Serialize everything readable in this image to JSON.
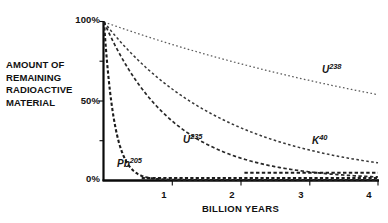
{
  "chart_data": {
    "type": "line",
    "title": "",
    "subtitle": "",
    "xlabel": "BILLION YEARS",
    "ylabel": "AMOUNT OF REMAINING RADIOACTIVE MATERIAL",
    "ylabel_lines": [
      "AMOUNT OF",
      "REMAINING",
      "RADIOACTIVE",
      "MATERIAL"
    ],
    "xlim": [
      0,
      4
    ],
    "ylim": [
      0,
      100
    ],
    "x_ticks": [
      1,
      2,
      3,
      4
    ],
    "x_tick_labels": [
      "1",
      "2",
      "3",
      "4"
    ],
    "y_ticks": [
      0,
      25,
      50,
      75,
      100
    ],
    "y_tick_labels_shown": [
      "0%",
      "50%",
      "100%"
    ],
    "y_tick_values_shown": [
      0,
      50,
      100
    ],
    "grid": false,
    "legend": "inline-annotations",
    "line_style": "dashed",
    "x": [
      0,
      0.25,
      0.5,
      0.75,
      1,
      1.25,
      1.5,
      1.75,
      2,
      2.25,
      2.5,
      2.75,
      3,
      3.25,
      3.5,
      3.75,
      4
    ],
    "series": [
      {
        "name": "U-238",
        "label_element": "U",
        "label_mass": "238",
        "half_life_billion_years": 4.5,
        "values": [
          100,
          96.2,
          92.6,
          89.1,
          85.7,
          82.4,
          79.4,
          76.3,
          73.5,
          70.7,
          68.0,
          65.4,
          63.0,
          60.6,
          58.3,
          56.1,
          53.9
        ]
      },
      {
        "name": "K-40",
        "label_element": "K",
        "label_mass": "40",
        "half_life_billion_years": 1.25,
        "values": [
          100,
          87.1,
          75.8,
          66.0,
          57.4,
          50.0,
          43.5,
          37.9,
          33.0,
          28.7,
          25.0,
          21.8,
          18.9,
          16.5,
          14.3,
          12.5,
          10.9
        ]
      },
      {
        "name": "U-235",
        "label_element": "U",
        "label_mass": "235",
        "half_life_billion_years": 0.7,
        "values": [
          100,
          78.1,
          61.0,
          47.6,
          37.2,
          29.1,
          22.7,
          17.7,
          13.8,
          10.8,
          8.4,
          6.6,
          5.1,
          4.0,
          3.1,
          2.4,
          1.9
        ]
      },
      {
        "name": "Pb-205",
        "label_element": "Pb",
        "label_mass": "205",
        "half_life_billion_years": 0.105,
        "values": [
          100,
          19.2,
          3.7,
          0.7,
          0.14,
          0.03,
          0.0,
          0.0,
          0.0,
          0.0,
          0.0,
          0.0,
          0.0,
          0.0,
          0.0,
          0.0,
          0.0
        ]
      }
    ],
    "annotations": [
      {
        "name": "U-238 curve label",
        "element": "U",
        "mass": "238"
      },
      {
        "name": "K-40 curve label",
        "element": "K",
        "mass": "40"
      },
      {
        "name": "U-235 curve label",
        "element": "U",
        "mass": "235"
      },
      {
        "name": "Pb-205 curve label",
        "element": "Pb",
        "mass": "205"
      }
    ]
  },
  "axes": {
    "y_title_lines": {
      "line1": "AMOUNT OF",
      "line2": "REMAINING",
      "line3": "RADIOACTIVE",
      "line4": "MATERIAL"
    },
    "y_labels": {
      "top": "100%",
      "middle": "50%",
      "bottom": "0%"
    },
    "x_labels": {
      "t1": "1",
      "t2": "2",
      "t3": "3",
      "t4": "4"
    },
    "x_title": "BILLION YEARS"
  },
  "series_labels": {
    "u238": {
      "element": "U",
      "mass": "238"
    },
    "k40": {
      "element": "K",
      "mass": "40"
    },
    "u235": {
      "element": "U",
      "mass": "235"
    },
    "pb205": {
      "element": "Pb",
      "mass": "205"
    }
  },
  "colors": {
    "ink": "#111111",
    "curve": "#1c1c1c",
    "background": "#ffffff"
  }
}
